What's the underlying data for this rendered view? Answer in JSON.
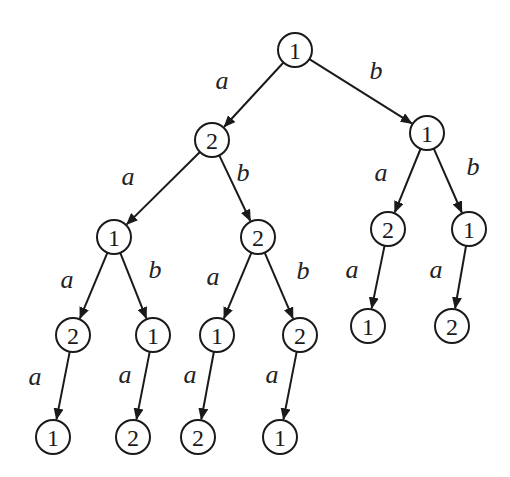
{
  "diagram": {
    "type": "tree",
    "title": "",
    "node_radius": 17,
    "colors": {
      "stroke": "#1a1a1a",
      "fill": "#ffffff",
      "text": "#1a1a1a"
    },
    "nodes": [
      {
        "id": "n0",
        "label": "1",
        "x": 295,
        "y": 50
      },
      {
        "id": "n1",
        "label": "2",
        "x": 212,
        "y": 140
      },
      {
        "id": "n2",
        "label": "1",
        "x": 427,
        "y": 133
      },
      {
        "id": "n3",
        "label": "1",
        "x": 114,
        "y": 237
      },
      {
        "id": "n4",
        "label": "2",
        "x": 258,
        "y": 237
      },
      {
        "id": "n5",
        "label": "2",
        "x": 388,
        "y": 229
      },
      {
        "id": "n6",
        "label": "1",
        "x": 469,
        "y": 229
      },
      {
        "id": "n7",
        "label": "2",
        "x": 73,
        "y": 335
      },
      {
        "id": "n8",
        "label": "1",
        "x": 153,
        "y": 335
      },
      {
        "id": "n9",
        "label": "1",
        "x": 217,
        "y": 335
      },
      {
        "id": "n10",
        "label": "2",
        "x": 300,
        "y": 335
      },
      {
        "id": "n11",
        "label": "1",
        "x": 368,
        "y": 326
      },
      {
        "id": "n12",
        "label": "2",
        "x": 452,
        "y": 326
      },
      {
        "id": "n13",
        "label": "1",
        "x": 53,
        "y": 437
      },
      {
        "id": "n14",
        "label": "2",
        "x": 133,
        "y": 437
      },
      {
        "id": "n15",
        "label": "2",
        "x": 198,
        "y": 437
      },
      {
        "id": "n16",
        "label": "1",
        "x": 280,
        "y": 437
      }
    ],
    "edges": [
      {
        "from": "n0",
        "to": "n1",
        "label": "a",
        "lx": 222,
        "ly": 80
      },
      {
        "from": "n0",
        "to": "n2",
        "label": "b",
        "lx": 376,
        "ly": 70
      },
      {
        "from": "n1",
        "to": "n3",
        "label": "a",
        "lx": 128,
        "ly": 176
      },
      {
        "from": "n1",
        "to": "n4",
        "label": "b",
        "lx": 243,
        "ly": 172
      },
      {
        "from": "n2",
        "to": "n5",
        "label": "a",
        "lx": 381,
        "ly": 172
      },
      {
        "from": "n2",
        "to": "n6",
        "label": "b",
        "lx": 473,
        "ly": 166
      },
      {
        "from": "n3",
        "to": "n7",
        "label": "a",
        "lx": 67,
        "ly": 279
      },
      {
        "from": "n3",
        "to": "n8",
        "label": "b",
        "lx": 155,
        "ly": 269
      },
      {
        "from": "n4",
        "to": "n9",
        "label": "a",
        "lx": 213,
        "ly": 276
      },
      {
        "from": "n4",
        "to": "n10",
        "label": "b",
        "lx": 303,
        "ly": 270
      },
      {
        "from": "n5",
        "to": "n11",
        "label": "a",
        "lx": 352,
        "ly": 269
      },
      {
        "from": "n6",
        "to": "n12",
        "label": "a",
        "lx": 436,
        "ly": 269
      },
      {
        "from": "n7",
        "to": "n13",
        "label": "a",
        "lx": 35,
        "ly": 376
      },
      {
        "from": "n8",
        "to": "n14",
        "label": "a",
        "lx": 125,
        "ly": 374
      },
      {
        "from": "n9",
        "to": "n15",
        "label": "a",
        "lx": 190,
        "ly": 374
      },
      {
        "from": "n10",
        "to": "n16",
        "label": "a",
        "lx": 272,
        "ly": 374
      }
    ]
  }
}
